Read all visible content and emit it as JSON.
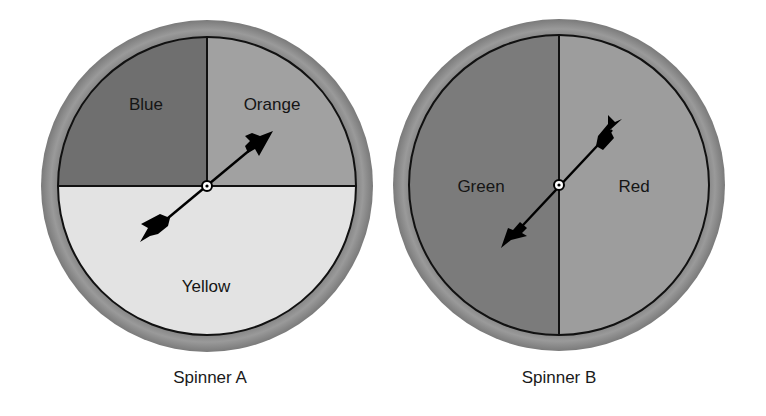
{
  "spinners": [
    {
      "name": "Spinner A",
      "center": [
        207,
        186
      ],
      "outer_radius": 166,
      "inner_radius": 149,
      "ring_color": "#8c8c8c",
      "sections": [
        {
          "label": "Blue",
          "color": "#6f6f6f",
          "fraction": 0.25,
          "label_pos": [
            146,
            104
          ]
        },
        {
          "label": "Orange",
          "color": "#a1a1a1",
          "fraction": 0.25,
          "label_pos": [
            272,
            104
          ]
        },
        {
          "label": "Yellow",
          "color": "#e3e3e3",
          "fraction": 0.5,
          "label_pos": [
            206,
            291
          ]
        }
      ],
      "arrow": {
        "tip": [
          273,
          131
        ],
        "tail": [
          140,
          242
        ],
        "points_to": "Orange"
      }
    },
    {
      "name": "Spinner B",
      "center": [
        559,
        185
      ],
      "outer_radius": 166,
      "inner_radius": 150,
      "ring_color": "#8c8c8c",
      "sections": [
        {
          "label": "Green",
          "color": "#7b7b7b",
          "fraction": 0.5,
          "label_pos": [
            480,
            192
          ]
        },
        {
          "label": "Red",
          "color": "#9d9d9d",
          "fraction": 0.5,
          "label_pos": [
            634,
            192
          ]
        }
      ],
      "arrow": {
        "tip": [
          501,
          248
        ],
        "tail": [
          622,
          119
        ],
        "points_to": "Green"
      }
    }
  ],
  "captions": {
    "a": "Spinner A",
    "b": "Spinner B"
  },
  "labels": {
    "blue": "Blue",
    "orange": "Orange",
    "yellow": "Yellow",
    "green": "Green",
    "red": "Red"
  }
}
